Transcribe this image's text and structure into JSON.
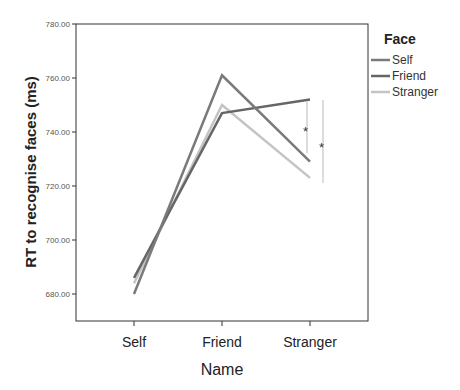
{
  "chart_data": {
    "type": "line",
    "title": "",
    "xlabel": "Name",
    "ylabel": "RT to recognise faces (ms)",
    "categories": [
      "Self",
      "Friend",
      "Stranger"
    ],
    "ylim": [
      670,
      780
    ],
    "yticks": [
      "780.00",
      "760.00",
      "740.00",
      "720.00",
      "700.00",
      "680.00"
    ],
    "grid": false,
    "legend": {
      "title": "Face",
      "position": "right"
    },
    "series": [
      {
        "name": "Self",
        "values": [
          680,
          761,
          729
        ],
        "color": "#7a7a7a"
      },
      {
        "name": "Friend",
        "values": [
          686,
          747,
          752
        ],
        "color": "#666666"
      },
      {
        "name": "Stranger",
        "values": [
          684,
          750,
          723
        ],
        "color": "#c4c4c4"
      }
    ],
    "annotations": [
      {
        "type": "significance",
        "label": "*",
        "between": "Friend vs Self at Stranger"
      },
      {
        "type": "significance",
        "label": "*",
        "between": "Friend vs Stranger at Stranger"
      }
    ]
  }
}
